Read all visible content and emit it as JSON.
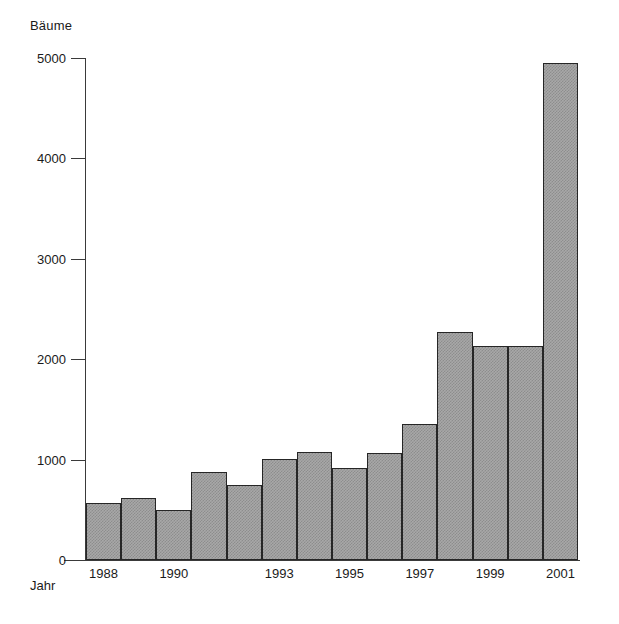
{
  "chart_data": {
    "type": "bar",
    "title": "",
    "ylabel": "Bäume",
    "xlabel": "Jahr",
    "ylim": [
      0,
      5000
    ],
    "yticks": [
      0,
      1000,
      2000,
      3000,
      4000,
      5000
    ],
    "ytick_labels": [
      "0",
      "1000",
      "2000",
      "3000",
      "4000",
      "5000"
    ],
    "grid": false,
    "legend": "none",
    "categories": [
      "1988",
      "1989",
      "1990",
      "1991",
      "1992",
      "1993",
      "1994",
      "1995",
      "1996",
      "1997",
      "1998",
      "1999",
      "2000",
      "2001"
    ],
    "visible_xtick_labels": [
      "1988",
      "1990",
      "1993",
      "1995",
      "1997",
      "1999",
      "2001"
    ],
    "xtick_label_indices": [
      0,
      2,
      5,
      7,
      9,
      11,
      13
    ],
    "values": [
      570,
      620,
      500,
      880,
      750,
      1010,
      1080,
      920,
      1070,
      1350,
      2270,
      2130,
      2130,
      4950
    ],
    "bar_color": "#a8a8a8",
    "bar_edge_color": "#262626",
    "axis_color": "#3a3a3a"
  },
  "axes": {
    "y_title": "Bäume",
    "x_title": "Jahr"
  }
}
